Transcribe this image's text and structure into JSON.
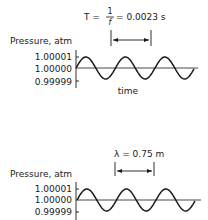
{
  "chart_data": [
    {
      "type": "line",
      "title": "Pressure vs time",
      "ylabel": "Pressure, atm",
      "xlabel": "time",
      "yticks": [
        "1.00001",
        "1.00000",
        "0.99999"
      ],
      "ylim": [
        0.99999,
        1.00001
      ],
      "annotation": {
        "prefix": "T =",
        "frac_num": "1",
        "frac_den": "f",
        "suffix": "= 0.0023 s"
      },
      "cycles": 3,
      "series": [
        {
          "name": "pressure",
          "shape": "sine",
          "mean": 1.0,
          "amplitude": 1e-05
        }
      ]
    },
    {
      "type": "line",
      "title": "Pressure vs distance",
      "ylabel": "Pressure, atm",
      "xlabel": "",
      "yticks": [
        "1.00001",
        "1.00000",
        "0.99999"
      ],
      "ylim": [
        0.99999,
        1.00001
      ],
      "annotation": {
        "text": "λ = 0.75 m"
      },
      "cycles": 3,
      "series": [
        {
          "name": "pressure",
          "shape": "sine",
          "mean": 1.0,
          "amplitude": 1e-05
        }
      ]
    }
  ]
}
